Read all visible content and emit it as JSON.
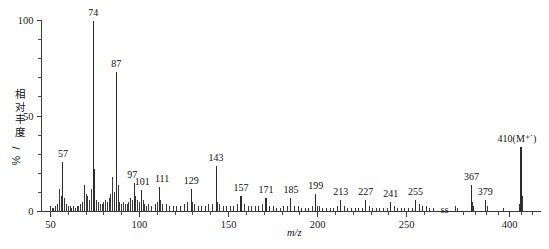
{
  "chart_data": {
    "type": "bar",
    "title": "",
    "xlabel": "m/z",
    "ylabel": "相对丰度/%",
    "ylabel_chars": [
      "相",
      "对",
      "丰",
      "度",
      "/",
      "%"
    ],
    "xlim": [
      45,
      420
    ],
    "ylim": [
      0,
      100
    ],
    "x_ticks": [
      50,
      100,
      150,
      200,
      250,
      400
    ],
    "x_tick_labels": [
      "50",
      "100",
      "150",
      "200",
      "250",
      "400"
    ],
    "x_minor_step": 10,
    "y_ticks": [
      0,
      50,
      100
    ],
    "y_tick_labels": [
      "0",
      "50",
      "100"
    ],
    "y_minor_step": 10,
    "grid": false,
    "axis_break": {
      "present": true,
      "position_mz": 268,
      "symbol": "ѕѕ"
    },
    "legend": null,
    "annotations": [
      {
        "mz": 57,
        "label": "57"
      },
      {
        "mz": 74,
        "label": "74"
      },
      {
        "mz": 87,
        "label": "87"
      },
      {
        "mz": 97,
        "label": "97"
      },
      {
        "mz": 101,
        "label": "101"
      },
      {
        "mz": 111,
        "label": "111"
      },
      {
        "mz": 129,
        "label": "129"
      },
      {
        "mz": 143,
        "label": "143"
      },
      {
        "mz": 157,
        "label": "157"
      },
      {
        "mz": 171,
        "label": "171"
      },
      {
        "mz": 185,
        "label": "185"
      },
      {
        "mz": 199,
        "label": "199"
      },
      {
        "mz": 213,
        "label": "213"
      },
      {
        "mz": 227,
        "label": "227"
      },
      {
        "mz": 241,
        "label": "241"
      },
      {
        "mz": 255,
        "label": "255"
      },
      {
        "mz": 367,
        "label": "367"
      },
      {
        "mz": 379,
        "label": "379"
      },
      {
        "mz": 410,
        "label": "410(M⁺˙)"
      }
    ],
    "x": [
      50,
      51,
      52,
      53,
      54,
      55,
      56,
      57,
      58,
      59,
      60,
      61,
      62,
      63,
      64,
      65,
      66,
      67,
      68,
      69,
      70,
      71,
      72,
      73,
      74,
      75,
      76,
      77,
      78,
      79,
      80,
      81,
      82,
      83,
      84,
      85,
      86,
      87,
      88,
      89,
      90,
      91,
      92,
      93,
      94,
      95,
      96,
      97,
      98,
      99,
      100,
      101,
      102,
      103,
      104,
      105,
      107,
      109,
      110,
      111,
      112,
      113,
      115,
      117,
      119,
      121,
      123,
      125,
      127,
      129,
      130,
      131,
      133,
      135,
      137,
      139,
      141,
      143,
      144,
      145,
      147,
      149,
      151,
      153,
      155,
      157,
      159,
      161,
      163,
      165,
      167,
      169,
      171,
      173,
      175,
      177,
      179,
      181,
      183,
      185,
      187,
      189,
      191,
      193,
      195,
      197,
      199,
      200,
      201,
      203,
      205,
      207,
      209,
      211,
      213,
      215,
      217,
      219,
      221,
      223,
      225,
      227,
      229,
      231,
      233,
      235,
      237,
      239,
      241,
      243,
      245,
      247,
      249,
      251,
      253,
      255,
      257,
      259,
      261,
      263,
      265,
      353,
      355,
      367,
      368,
      369,
      379,
      381,
      395,
      409,
      410,
      411
    ],
    "values": [
      3,
      2,
      2,
      3,
      4,
      12,
      8,
      26,
      7,
      4,
      3,
      3,
      2,
      3,
      2,
      3,
      3,
      4,
      5,
      14,
      9,
      8,
      6,
      12,
      100,
      22,
      6,
      5,
      4,
      4,
      5,
      6,
      5,
      7,
      9,
      18,
      10,
      73,
      14,
      5,
      4,
      5,
      4,
      4,
      5,
      7,
      6,
      15,
      8,
      6,
      5,
      11,
      6,
      4,
      3,
      4,
      3,
      4,
      5,
      13,
      6,
      4,
      4,
      3,
      3,
      3,
      3,
      4,
      5,
      12,
      5,
      4,
      3,
      3,
      3,
      4,
      4,
      24,
      5,
      4,
      3,
      3,
      3,
      3,
      4,
      8,
      4,
      3,
      3,
      3,
      3,
      4,
      7,
      3,
      3,
      2,
      2,
      3,
      3,
      7,
      3,
      3,
      2,
      2,
      2,
      3,
      9,
      3,
      3,
      2,
      2,
      2,
      2,
      3,
      6,
      3,
      2,
      2,
      2,
      2,
      2,
      6,
      3,
      2,
      2,
      2,
      2,
      2,
      5,
      3,
      2,
      2,
      2,
      2,
      2,
      6,
      4,
      3,
      3,
      2,
      2,
      3,
      2,
      14,
      5,
      3,
      6,
      3,
      2,
      4,
      34,
      8
    ]
  }
}
